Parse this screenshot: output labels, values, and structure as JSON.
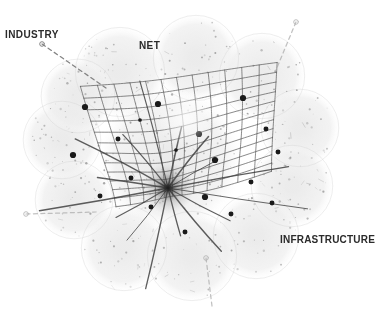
{
  "figure": {
    "title": "Industry Net Infrastructure",
    "background_color": "#ffffff",
    "blob_color": "#f1f1f1",
    "blob_edge_color": "#e6e6e6",
    "grid_line_color": "#555555",
    "node_color": "#1a1a1a",
    "label_color": "#2b2b2b",
    "speckle_color": "#9a9a9a",
    "dash_color": "#8c8c8c"
  },
  "labels": [
    {
      "id": "industry",
      "text": "INDUSTRY",
      "x": 5,
      "y": 30
    },
    {
      "id": "net",
      "text": "NET",
      "x": 139,
      "y": 41
    },
    {
      "id": "infrastructure",
      "text": "INFRASTRUCTURE",
      "x": 280,
      "y": 235
    }
  ],
  "chart_data": {
    "type": "scatter",
    "title": "Industry Net Infrastructure",
    "xlabel": "",
    "ylabel": "",
    "xlim": [
      0,
      375
    ],
    "ylim": [
      0,
      315
    ],
    "grid": true,
    "legend_position": "none",
    "annotations": [
      "INDUSTRY",
      "NET",
      "INFRASTRUCTURE"
    ],
    "focal_point": {
      "x": 168,
      "y": 188,
      "label": "convergence-singularity",
      "radius": 26
    },
    "mesh": {
      "description": "curvilinear quadrilateral grid warped toward focal point",
      "u_lines": 13,
      "v_lines": 13,
      "corners": [
        {
          "x": 68,
          "y": 72
        },
        {
          "x": 288,
          "y": 50
        },
        {
          "x": 292,
          "y": 168
        },
        {
          "x": 96,
          "y": 214
        }
      ],
      "bottom_tip": {
        "x": 226,
        "y": 276
      }
    },
    "nodes": [
      {
        "x": 85,
        "y": 107,
        "size": 5
      },
      {
        "x": 158,
        "y": 104,
        "size": 5
      },
      {
        "x": 243,
        "y": 98,
        "size": 5
      },
      {
        "x": 73,
        "y": 155,
        "size": 5
      },
      {
        "x": 118,
        "y": 139,
        "size": 4
      },
      {
        "x": 199,
        "y": 134,
        "size": 5
      },
      {
        "x": 266,
        "y": 129,
        "size": 4
      },
      {
        "x": 131,
        "y": 178,
        "size": 4
      },
      {
        "x": 215,
        "y": 160,
        "size": 5
      },
      {
        "x": 278,
        "y": 152,
        "size": 4
      },
      {
        "x": 100,
        "y": 196,
        "size": 4
      },
      {
        "x": 151,
        "y": 207,
        "size": 4
      },
      {
        "x": 205,
        "y": 197,
        "size": 5
      },
      {
        "x": 251,
        "y": 182,
        "size": 4
      },
      {
        "x": 185,
        "y": 232,
        "size": 4
      },
      {
        "x": 231,
        "y": 214,
        "size": 4
      },
      {
        "x": 272,
        "y": 203,
        "size": 4
      },
      {
        "x": 140,
        "y": 120,
        "size": 3
      },
      {
        "x": 176,
        "y": 150,
        "size": 3
      }
    ],
    "radial_spokes": 16,
    "blobs": [
      {
        "cx": 120,
        "cy": 72,
        "r": 46
      },
      {
        "cx": 196,
        "cy": 58,
        "r": 44
      },
      {
        "cx": 262,
        "cy": 76,
        "r": 44
      },
      {
        "cx": 300,
        "cy": 128,
        "r": 40
      },
      {
        "cx": 292,
        "cy": 186,
        "r": 42
      },
      {
        "cx": 256,
        "cy": 236,
        "r": 44
      },
      {
        "cx": 192,
        "cy": 256,
        "r": 46
      },
      {
        "cx": 124,
        "cy": 248,
        "r": 44
      },
      {
        "cx": 74,
        "cy": 200,
        "r": 40
      },
      {
        "cx": 62,
        "cy": 140,
        "r": 40
      },
      {
        "cx": 78,
        "cy": 96,
        "r": 38
      },
      {
        "cx": 170,
        "cy": 160,
        "r": 72
      }
    ],
    "leader_lines": [
      {
        "from_label": "INDUSTRY",
        "x1": 42,
        "y1": 44,
        "x2": 106,
        "y2": 88,
        "dashed": true,
        "marker": "circle"
      },
      {
        "from_label": "left-edge",
        "x1": 26,
        "y1": 214,
        "x2": 96,
        "y2": 212,
        "dashed": true,
        "marker": "circle"
      },
      {
        "from_label": "bottom",
        "x1": 206,
        "y1": 258,
        "x2": 212,
        "y2": 306,
        "dashed": true,
        "marker": "circle"
      },
      {
        "from_label": "upper-right",
        "x1": 296,
        "y1": 22,
        "x2": 276,
        "y2": 70,
        "dashed": true,
        "marker": "circle"
      }
    ]
  }
}
